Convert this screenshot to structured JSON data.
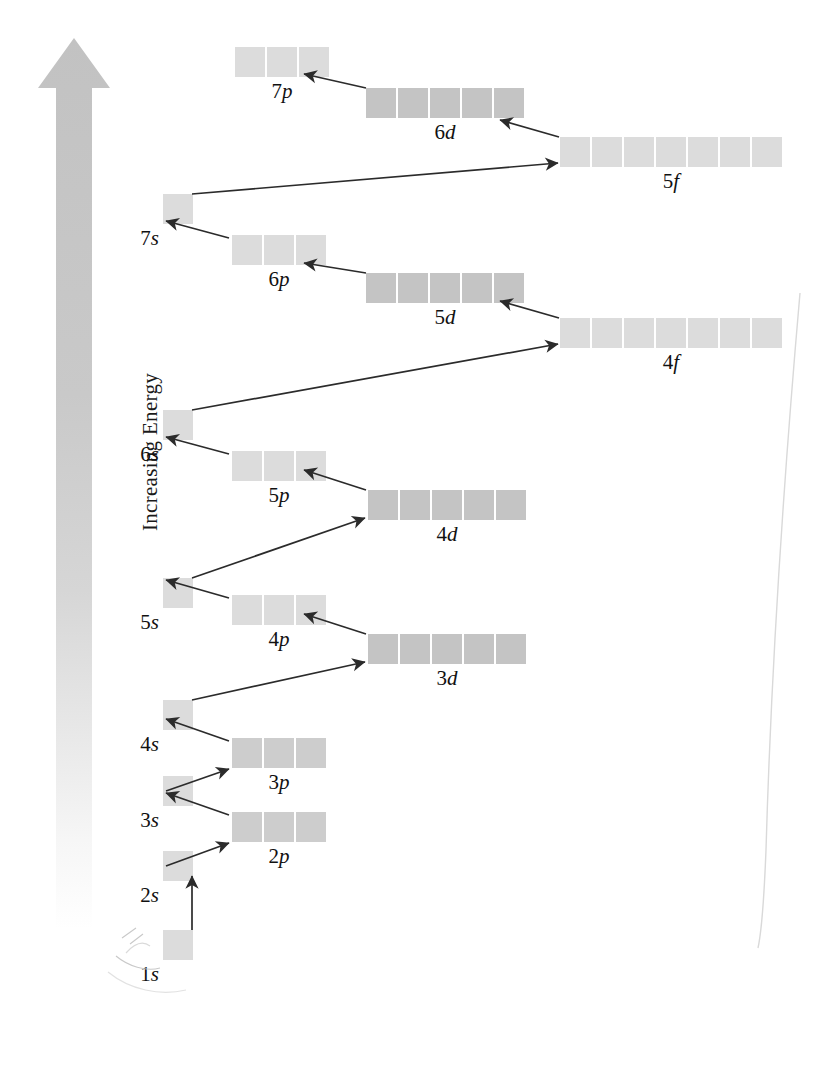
{
  "diagram": {
    "axis": {
      "label": "Increasing Energy",
      "icon": "up-arrow-icon",
      "direction": "up",
      "color": "#c9c9c9"
    },
    "colors": {
      "box_light": "#dcdcdc",
      "box_mid": "#cdcdcd",
      "box_dark": "#c4c4c4",
      "arrow": "#2b2b2b",
      "text": "#111111",
      "background": "#ffffff"
    },
    "orbitals": [
      {
        "label": "7p",
        "n": "7",
        "type": "p",
        "boxes": 3,
        "shade": "light",
        "x": 235,
        "y": 47,
        "label_offset": 0
      },
      {
        "label": "6d",
        "n": "6",
        "type": "d",
        "boxes": 5,
        "shade": "dark",
        "x": 366,
        "y": 88,
        "label_offset": 0
      },
      {
        "label": "5f",
        "n": "5",
        "type": "f",
        "boxes": 7,
        "shade": "light",
        "x": 560,
        "y": 137,
        "label_offset": 0
      },
      {
        "label": "7s",
        "n": "7",
        "type": "s",
        "boxes": 1,
        "shade": "light",
        "x": 163,
        "y": 194,
        "label_offset": 0
      },
      {
        "label": "6p",
        "n": "6",
        "type": "p",
        "boxes": 3,
        "shade": "light",
        "x": 232,
        "y": 235,
        "label_offset": 0
      },
      {
        "label": "5d",
        "n": "5",
        "type": "d",
        "boxes": 5,
        "shade": "dark",
        "x": 366,
        "y": 273,
        "label_offset": 0
      },
      {
        "label": "4f",
        "n": "4",
        "type": "f",
        "boxes": 7,
        "shade": "light",
        "x": 560,
        "y": 318,
        "label_offset": 0
      },
      {
        "label": "6s",
        "n": "6",
        "type": "s",
        "boxes": 1,
        "shade": "light",
        "x": 163,
        "y": 410,
        "label_offset": 0
      },
      {
        "label": "5p",
        "n": "5",
        "type": "p",
        "boxes": 3,
        "shade": "light",
        "x": 232,
        "y": 451,
        "label_offset": 0
      },
      {
        "label": "4d",
        "n": "4",
        "type": "d",
        "boxes": 5,
        "shade": "dark",
        "x": 368,
        "y": 490,
        "label_offset": 0
      },
      {
        "label": "5s",
        "n": "5",
        "type": "s",
        "boxes": 1,
        "shade": "light",
        "x": 163,
        "y": 578,
        "label_offset": 0
      },
      {
        "label": "4p",
        "n": "4",
        "type": "p",
        "boxes": 3,
        "shade": "light",
        "x": 232,
        "y": 595,
        "label_offset": 0
      },
      {
        "label": "3d",
        "n": "3",
        "type": "d",
        "boxes": 5,
        "shade": "dark",
        "x": 368,
        "y": 634,
        "label_offset": 0
      },
      {
        "label": "4s",
        "n": "4",
        "type": "s",
        "boxes": 1,
        "shade": "light",
        "x": 163,
        "y": 700,
        "label_offset": 0
      },
      {
        "label": "3p",
        "n": "3",
        "type": "p",
        "boxes": 3,
        "shade": "mid",
        "x": 232,
        "y": 738,
        "label_offset": 0
      },
      {
        "label": "3s",
        "n": "3",
        "type": "s",
        "boxes": 1,
        "shade": "light",
        "x": 163,
        "y": 776,
        "label_offset": 0
      },
      {
        "label": "2p",
        "n": "2",
        "type": "p",
        "boxes": 3,
        "shade": "mid",
        "x": 232,
        "y": 812,
        "label_offset": 0
      },
      {
        "label": "2s",
        "n": "2",
        "type": "s",
        "boxes": 1,
        "shade": "light",
        "x": 163,
        "y": 851,
        "label_offset": 0
      },
      {
        "label": "1s",
        "n": "1",
        "type": "s",
        "boxes": 1,
        "shade": "light",
        "x": 163,
        "y": 930,
        "label_offset": 0
      }
    ],
    "fill_arrows": [
      {
        "from": "1s",
        "to": "2s",
        "kind": "vertical"
      },
      {
        "from": "2s",
        "to": "2p",
        "kind": "short-up-right"
      },
      {
        "from": "2p",
        "to": "3s",
        "kind": "short-down-left"
      },
      {
        "from": "3s",
        "to": "3p",
        "kind": "short-up-right"
      },
      {
        "from": "3p",
        "to": "4s",
        "kind": "short-down-left"
      },
      {
        "from": "4s",
        "to": "3d",
        "kind": "long-diagonal"
      },
      {
        "from": "3d",
        "to": "4p",
        "kind": "short-up-left"
      },
      {
        "from": "4p",
        "to": "5s",
        "kind": "short-up-left"
      },
      {
        "from": "5s",
        "to": "4d",
        "kind": "long-diagonal"
      },
      {
        "from": "4d",
        "to": "5p",
        "kind": "short-up-left"
      },
      {
        "from": "5p",
        "to": "6s",
        "kind": "short-up-left"
      },
      {
        "from": "6s",
        "to": "4f",
        "kind": "long-diagonal"
      },
      {
        "from": "4f",
        "to": "5d",
        "kind": "short-up-left"
      },
      {
        "from": "5d",
        "to": "6p",
        "kind": "short-up-left"
      },
      {
        "from": "6p",
        "to": "7s",
        "kind": "short-up-left"
      },
      {
        "from": "7s",
        "to": "5f",
        "kind": "long-diagonal"
      },
      {
        "from": "5f",
        "to": "6d",
        "kind": "short-up-left"
      },
      {
        "from": "6d",
        "to": "7p",
        "kind": "short-up-left"
      }
    ]
  }
}
